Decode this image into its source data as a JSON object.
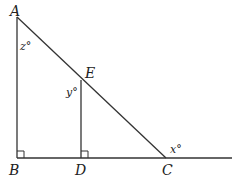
{
  "diagram": {
    "type": "geometry",
    "points": {
      "A": {
        "label": "A",
        "x": 17,
        "y": 17
      },
      "B": {
        "label": "B",
        "x": 17,
        "y": 158
      },
      "D": {
        "label": "D",
        "x": 81,
        "y": 158
      },
      "C": {
        "label": "C",
        "x": 166,
        "y": 158
      },
      "E": {
        "label": "E",
        "x": 81,
        "y": 80
      }
    },
    "angles": {
      "z": "z°",
      "y": "y°",
      "x": "x°"
    },
    "segments": [
      "AB",
      "BC",
      "AC",
      "ED",
      "C-extension"
    ],
    "right_angles": [
      "B",
      "D"
    ],
    "stroke_color": "#333333"
  }
}
